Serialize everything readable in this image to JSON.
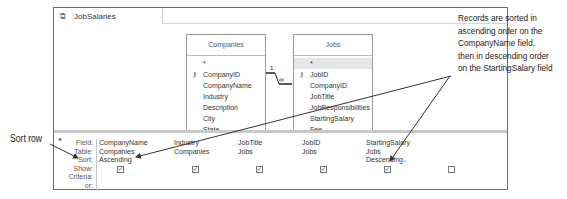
{
  "window": {
    "tab_label": "JobSalaries",
    "tab_icon": "query-icon"
  },
  "tables": [
    {
      "title": "Companies",
      "fields": [
        "*",
        "CompanyID",
        "CompanyName",
        "Industry",
        "Description",
        "City",
        "State"
      ],
      "key_field": "CompanyID"
    },
    {
      "title": "Jobs",
      "fields": [
        "*",
        "JobID",
        "CompanyID",
        "JobTitle",
        "JobResponsibilities",
        "StartingSalary",
        "Fee"
      ],
      "key_field": "JobID"
    }
  ],
  "relationship": {
    "one_side": "1",
    "many_side": "∞"
  },
  "grid": {
    "row_labels": [
      "Field:",
      "Table:",
      "Sort:",
      "Show:",
      "Criteria:",
      "or:"
    ],
    "columns": [
      {
        "field": "CompanyName",
        "table": "Companies",
        "sort": "Ascending",
        "show": true
      },
      {
        "field": "Industry",
        "table": "Companies",
        "sort": "",
        "show": true
      },
      {
        "field": "JobTitle",
        "table": "Jobs",
        "sort": "",
        "show": true
      },
      {
        "field": "JobID",
        "table": "Jobs",
        "sort": "",
        "show": true
      },
      {
        "field": "StartingSalary",
        "table": "Jobs",
        "sort": "Descending",
        "show": true
      },
      {
        "field": "",
        "table": "",
        "sort": "",
        "show": false
      }
    ]
  },
  "callouts": {
    "right": "Records are sorted in ascending order on the CompanyName field, then in descending order on the StartingSalary field",
    "left": "Sort row"
  }
}
